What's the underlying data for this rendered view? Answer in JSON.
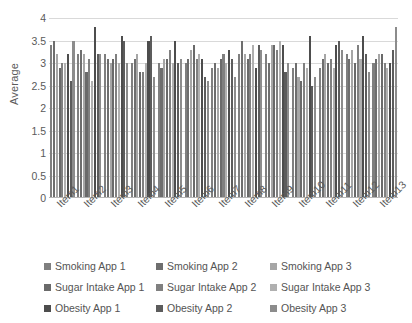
{
  "chart_data": {
    "type": "bar",
    "title": "",
    "xlabel": "",
    "ylabel": "Average",
    "ylim": [
      0,
      4
    ],
    "ytick_step": 0.5,
    "yticks": [
      "4",
      "3.5",
      "3",
      "2.5",
      "2",
      "1.5",
      "1",
      "0.5",
      "0"
    ],
    "grid": true,
    "legend_position": "bottom",
    "categories": [
      "Item1",
      "Item2",
      "Item3",
      "Item4",
      "Item5",
      "Item6",
      "Item7",
      "Item8",
      "Item9",
      "Item10",
      "Item11",
      "Item12",
      "Item13"
    ],
    "series": [
      {
        "name": "Smoking App 1",
        "color": "#7f7f7f",
        "values": [
          3.4,
          3.2,
          3.2,
          3.0,
          3.0,
          3.0,
          2.9,
          3.2,
          3.2,
          2.9,
          2.9,
          3.2,
          3.0
        ]
      },
      {
        "name": "Smoking App 2",
        "color": "#6e6e6e",
        "values": [
          3.5,
          3.3,
          3.1,
          3.1,
          2.9,
          3.1,
          3.0,
          3.5,
          3.0,
          3.0,
          3.1,
          3.1,
          3.1
        ]
      },
      {
        "name": "Smoking App 3",
        "color": "#a6a6a6",
        "values": [
          3.2,
          3.2,
          3.0,
          3.2,
          3.1,
          3.3,
          2.9,
          3.2,
          3.4,
          2.7,
          3.2,
          3.3,
          3.2
        ]
      },
      {
        "name": "Sugar Intake App 1",
        "color": "#6a6a6a",
        "values": [
          2.9,
          2.8,
          3.1,
          2.8,
          3.1,
          3.4,
          3.1,
          3.1,
          3.4,
          2.6,
          3.0,
          3.0,
          3.2
        ]
      },
      {
        "name": "Sugar Intake App 2",
        "color": "#808080",
        "values": [
          3.0,
          3.1,
          3.2,
          2.8,
          3.3,
          3.1,
          3.2,
          3.2,
          3.3,
          3.0,
          3.1,
          3.4,
          3.0
        ]
      },
      {
        "name": "Sugar Intake App 3",
        "color": "#b0b0b0",
        "values": [
          3.0,
          2.6,
          3.0,
          3.0,
          3.0,
          3.2,
          3.0,
          3.4,
          3.5,
          2.9,
          2.9,
          3.1,
          2.9
        ]
      },
      {
        "name": "Obesity App 1",
        "color": "#4d4d4d",
        "values": [
          3.2,
          3.8,
          3.6,
          3.5,
          3.5,
          3.1,
          3.3,
          2.9,
          3.4,
          3.6,
          3.4,
          3.6,
          3.0
        ]
      },
      {
        "name": "Obesity App 2",
        "color": "#5c5c5c",
        "values": [
          2.6,
          3.2,
          3.5,
          3.6,
          3.0,
          2.7,
          3.1,
          3.4,
          2.8,
          2.5,
          3.5,
          3.2,
          3.3
        ]
      },
      {
        "name": "Obesity App 3",
        "color": "#8c8c8c",
        "values": [
          3.5,
          3.2,
          3.0,
          2.7,
          3.1,
          2.6,
          2.7,
          3.3,
          3.0,
          2.7,
          3.3,
          2.8,
          3.8
        ]
      }
    ]
  },
  "legend": {
    "rows": [
      [
        "Smoking App 1",
        "Smoking App 2",
        "Smoking App 3"
      ],
      [
        "Sugar Intake App 1",
        "Sugar Intake App 2",
        "Sugar Intake App 3"
      ],
      [
        "Obesity App 1",
        "Obesity App 2",
        "Obesity App 3"
      ]
    ]
  }
}
